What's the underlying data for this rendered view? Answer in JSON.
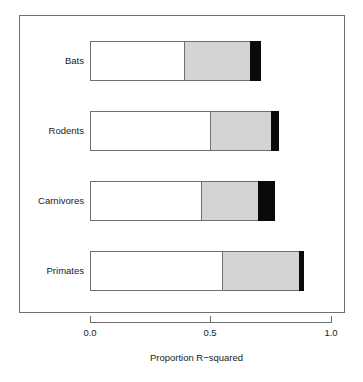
{
  "chart_data": {
    "type": "bar",
    "orientation": "horizontal",
    "stacked": true,
    "title": "",
    "xlabel": "Proportion R−squared",
    "ylabel": "",
    "xlim": [
      0.0,
      1.0
    ],
    "xticks": [
      "0.0",
      "0.5",
      "1.0"
    ],
    "xtick_values": [
      0.0,
      0.5,
      1.0
    ],
    "grid": false,
    "legend": null,
    "categories": [
      "Bats",
      "Rodents",
      "Carnivores",
      "Primates"
    ],
    "series": [
      {
        "name": "segment-1-white",
        "color": "#ffffff",
        "values": [
          0.395,
          0.503,
          0.465,
          0.552
        ]
      },
      {
        "name": "segment-2-gray",
        "color": "#d4d4d4",
        "values": [
          0.278,
          0.257,
          0.241,
          0.324
        ]
      },
      {
        "name": "segment-3-black",
        "color": "#0a0a0a",
        "values": [
          0.046,
          0.033,
          0.07,
          0.021
        ]
      }
    ],
    "cumulative_ends": [
      [
        0.395,
        0.673,
        0.719
      ],
      [
        0.503,
        0.76,
        0.793
      ],
      [
        0.465,
        0.706,
        0.776
      ],
      [
        0.552,
        0.876,
        0.897
      ]
    ],
    "bar_totals": [
      0.719,
      0.793,
      0.776,
      0.897
    ]
  },
  "axis": {
    "tick_labels": [
      "0.0",
      "0.5",
      "1.0"
    ],
    "title": "Proportion R−squared"
  },
  "category_labels": [
    "Bats",
    "Rodents",
    "Carnivores",
    "Primates"
  ],
  "colors": {
    "frame": "#6f6f6f",
    "segment_white": "#ffffff",
    "segment_gray": "#d4d4d4",
    "segment_black": "#0a0a0a",
    "text": "#1a1a1a",
    "background": "#ffffff"
  }
}
